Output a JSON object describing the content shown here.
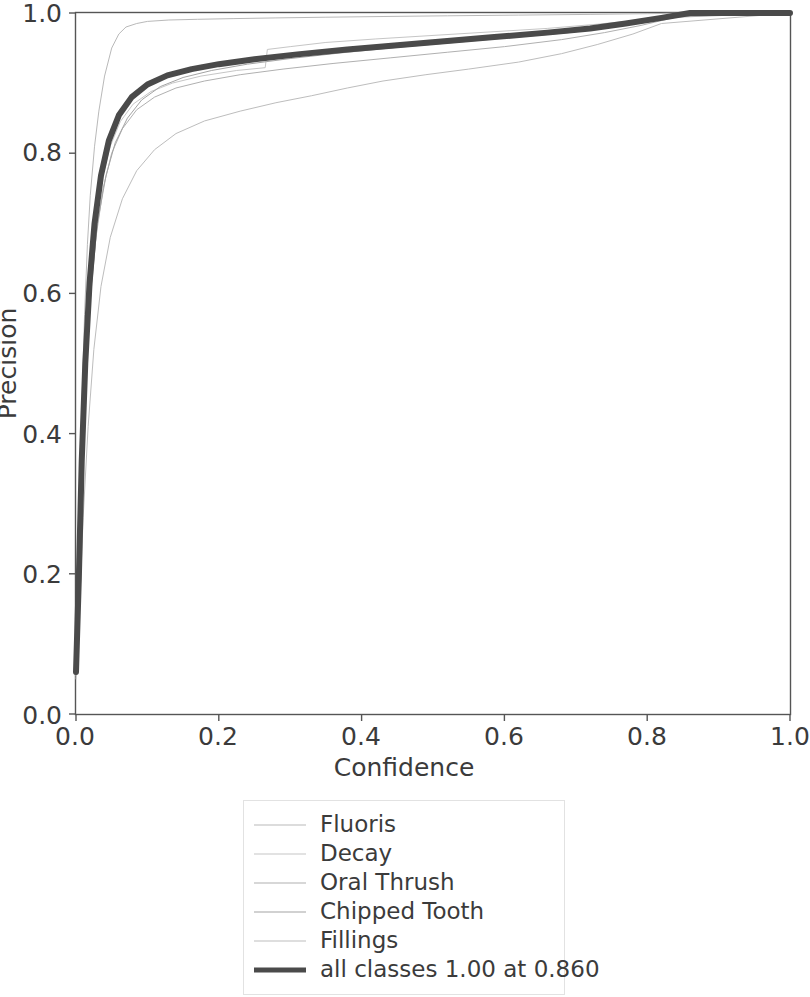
{
  "chart_data": {
    "type": "line",
    "title": "",
    "xlabel": "Confidence",
    "ylabel": "Precision",
    "xlim": [
      0.0,
      1.0
    ],
    "ylim": [
      0.0,
      1.0
    ],
    "xticks": [
      "0.0",
      "0.2",
      "0.4",
      "0.6",
      "0.8",
      "1.0"
    ],
    "yticks": [
      "0.0",
      "0.2",
      "0.4",
      "0.6",
      "0.8",
      "1.0"
    ],
    "grid": false,
    "legend_position": "below-center",
    "summary_text": "all classes 1.00 at 0.860",
    "summary_precision": 1.0,
    "summary_confidence": 0.86,
    "series": [
      {
        "name": "Fluoris",
        "color": "#b9b9b9",
        "width": 1,
        "x": [
          0.0,
          0.004,
          0.008,
          0.012,
          0.016,
          0.02,
          0.026,
          0.032,
          0.04,
          0.05,
          0.06,
          0.07,
          0.085,
          0.1,
          0.13,
          0.17,
          0.22,
          0.28,
          0.35,
          0.43,
          0.52,
          0.62,
          0.72,
          0.8,
          0.86,
          1.0
        ],
        "y": [
          0.07,
          0.24,
          0.43,
          0.57,
          0.67,
          0.74,
          0.81,
          0.86,
          0.91,
          0.95,
          0.97,
          0.98,
          0.985,
          0.988,
          0.99,
          0.991,
          0.992,
          0.993,
          0.994,
          0.995,
          0.996,
          0.997,
          0.998,
          0.999,
          1.0,
          1.0
        ]
      },
      {
        "name": "Decay",
        "color": "#c6c6c6",
        "width": 1,
        "x": [
          0.0,
          0.004,
          0.008,
          0.012,
          0.018,
          0.025,
          0.035,
          0.048,
          0.062,
          0.08,
          0.105,
          0.135,
          0.175,
          0.225,
          0.265,
          0.268,
          0.3,
          0.35,
          0.42,
          0.5,
          0.58,
          0.66,
          0.73,
          0.79,
          0.83,
          1.0
        ],
        "y": [
          0.06,
          0.19,
          0.35,
          0.48,
          0.6,
          0.69,
          0.76,
          0.81,
          0.845,
          0.87,
          0.888,
          0.9,
          0.91,
          0.918,
          0.922,
          0.948,
          0.952,
          0.958,
          0.963,
          0.968,
          0.973,
          0.978,
          0.984,
          0.99,
          0.996,
          1.0
        ]
      },
      {
        "name": "Oral Thrush",
        "color": "#b0b0b0",
        "width": 1,
        "x": [
          0.0,
          0.004,
          0.008,
          0.013,
          0.02,
          0.028,
          0.038,
          0.05,
          0.065,
          0.085,
          0.11,
          0.14,
          0.18,
          0.23,
          0.29,
          0.36,
          0.44,
          0.52,
          0.6,
          0.68,
          0.74,
          0.79,
          0.84,
          1.0
        ],
        "y": [
          0.055,
          0.17,
          0.32,
          0.46,
          0.59,
          0.68,
          0.75,
          0.8,
          0.835,
          0.862,
          0.88,
          0.893,
          0.903,
          0.912,
          0.92,
          0.928,
          0.936,
          0.944,
          0.952,
          0.962,
          0.972,
          0.982,
          0.994,
          1.0
        ]
      },
      {
        "name": "Chipped Tooth",
        "color": "#a3a3a3",
        "width": 1,
        "x": [
          0.0,
          0.004,
          0.009,
          0.015,
          0.022,
          0.03,
          0.042,
          0.055,
          0.072,
          0.092,
          0.118,
          0.15,
          0.19,
          0.24,
          0.3,
          0.37,
          0.45,
          0.53,
          0.61,
          0.69,
          0.75,
          0.8,
          0.845,
          1.0
        ],
        "y": [
          0.06,
          0.2,
          0.37,
          0.51,
          0.62,
          0.7,
          0.768,
          0.815,
          0.85,
          0.876,
          0.895,
          0.908,
          0.918,
          0.927,
          0.935,
          0.943,
          0.951,
          0.958,
          0.965,
          0.972,
          0.98,
          0.987,
          0.995,
          1.0
        ]
      },
      {
        "name": "Fillings",
        "color": "#bdbdbd",
        "width": 1,
        "x": [
          0.0,
          0.005,
          0.01,
          0.017,
          0.025,
          0.035,
          0.048,
          0.065,
          0.085,
          0.11,
          0.14,
          0.18,
          0.23,
          0.28,
          0.33,
          0.38,
          0.43,
          0.49,
          0.55,
          0.62,
          0.68,
          0.73,
          0.78,
          0.82,
          1.0
        ],
        "y": [
          0.05,
          0.15,
          0.28,
          0.41,
          0.52,
          0.61,
          0.68,
          0.735,
          0.775,
          0.805,
          0.828,
          0.846,
          0.86,
          0.872,
          0.882,
          0.893,
          0.903,
          0.912,
          0.92,
          0.93,
          0.942,
          0.955,
          0.97,
          0.985,
          1.0
        ]
      },
      {
        "name": "all classes 1.00 at 0.860",
        "color": "#4a4a4a",
        "width": 6,
        "x": [
          0.0,
          0.004,
          0.008,
          0.013,
          0.019,
          0.026,
          0.035,
          0.046,
          0.06,
          0.078,
          0.1,
          0.128,
          0.162,
          0.2,
          0.25,
          0.31,
          0.38,
          0.45,
          0.52,
          0.59,
          0.66,
          0.72,
          0.77,
          0.82,
          0.86,
          1.0
        ],
        "y": [
          0.06,
          0.195,
          0.36,
          0.5,
          0.615,
          0.7,
          0.768,
          0.818,
          0.854,
          0.88,
          0.898,
          0.911,
          0.92,
          0.927,
          0.934,
          0.941,
          0.948,
          0.954,
          0.96,
          0.966,
          0.972,
          0.978,
          0.985,
          0.993,
          1.0,
          1.0
        ]
      }
    ]
  },
  "axes": {
    "xlabel": "Confidence",
    "ylabel": "Precision",
    "xticks": [
      "0.0",
      "0.2",
      "0.4",
      "0.6",
      "0.8",
      "1.0"
    ],
    "yticks": [
      "0.0",
      "0.2",
      "0.4",
      "0.6",
      "0.8",
      "1.0"
    ]
  },
  "legend": {
    "items": [
      {
        "label": "Fluoris"
      },
      {
        "label": "Decay"
      },
      {
        "label": "Oral Thrush"
      },
      {
        "label": "Chipped Tooth"
      },
      {
        "label": "Fillings"
      },
      {
        "label": "all classes 1.00 at 0.860"
      }
    ]
  },
  "colors": {
    "axis": "#3b3b3b",
    "frame": "#555555",
    "mean_curve": "#4a4a4a",
    "legend_border": "#e2e2e2",
    "background": "#ffffff"
  }
}
